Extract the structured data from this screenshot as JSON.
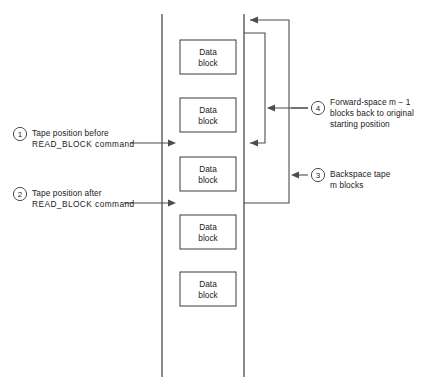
{
  "diagram": {
    "colors": {
      "line": "#4d4d4d",
      "block_border": "#4d4d4d",
      "text": "#1a1a1a",
      "background": "#ffffff"
    },
    "tape": {
      "left_edge_x": 162,
      "right_edge_x": 244,
      "top_y": 14,
      "bottom_y": 377
    },
    "blocks": [
      {
        "id": "data-block-1",
        "line1": "Data",
        "line2": "block",
        "x": 180,
        "y": 40,
        "w": 56,
        "h": 34
      },
      {
        "id": "data-block-2",
        "line1": "Data",
        "line2": "block",
        "x": 180,
        "y": 98,
        "w": 56,
        "h": 34
      },
      {
        "id": "data-block-3",
        "line1": "Data",
        "line2": "block",
        "x": 180,
        "y": 157,
        "w": 56,
        "h": 34
      },
      {
        "id": "data-block-4",
        "line1": "Data",
        "line2": "block",
        "x": 180,
        "y": 215,
        "w": 56,
        "h": 34
      },
      {
        "id": "data-block-5",
        "line1": "Data",
        "line2": "block",
        "x": 180,
        "y": 272,
        "w": 56,
        "h": 34
      }
    ],
    "callouts": [
      {
        "number": "1",
        "name": "callout-tape-position-before",
        "lines": [
          "Tape position before",
          "READ_BLOCK command"
        ],
        "circle_cx": 20,
        "circle_cy": 134,
        "text_x": 32,
        "text_y": 128,
        "leader": {
          "from_x": 130,
          "from_y": 143,
          "to_x": 176,
          "to_y": 143,
          "arrow": "right"
        }
      },
      {
        "number": "2",
        "name": "callout-tape-position-after",
        "lines": [
          "Tape position after",
          "READ_BLOCK command"
        ],
        "circle_cx": 20,
        "circle_cy": 194,
        "text_x": 32,
        "text_y": 188,
        "leader": {
          "from_x": 124,
          "from_y": 203,
          "to_x": 176,
          "to_y": 203,
          "arrow": "right"
        }
      },
      {
        "number": "3",
        "name": "callout-backspace-tape",
        "lines": [
          "Backspace tape",
          "m blocks"
        ],
        "circle_cx": 318,
        "circle_cy": 175,
        "text_x": 330,
        "text_y": 169,
        "leader": {
          "from_x": 308,
          "from_y": 175,
          "to_x": 291,
          "to_y": 175,
          "arrow": "left"
        }
      },
      {
        "number": "4",
        "name": "callout-forward-space",
        "lines": [
          "Forward-space m − 1",
          "blocks back to original",
          "starting position"
        ],
        "circle_cx": 318,
        "circle_cy": 108,
        "text_x": 330,
        "text_y": 97,
        "leader": {
          "from_x": 308,
          "from_y": 108,
          "to_x": 291,
          "to_y": 108,
          "arrow": "none"
        }
      }
    ],
    "paths": {
      "backspace": {
        "name": "backspace-path",
        "description": "Outer path: from tape position after, right and up to tape top",
        "points": "244,203 289,203 289,20 248,20",
        "arrow_at": {
          "x": 248,
          "y": 20,
          "dir": "left"
        }
      },
      "forward_space": {
        "name": "forward-space-path",
        "description": "Inner path: from tape top down and left to original read position",
        "points": "244,33 265,33 265,143 248,143",
        "arrow_at": {
          "x": 248,
          "y": 143,
          "dir": "left"
        }
      },
      "callout4_connector": {
        "name": "callout-4-connector",
        "points": "308,108 265,108",
        "arrow_at": {
          "x": 265,
          "y": 108,
          "dir": "left"
        }
      }
    }
  }
}
